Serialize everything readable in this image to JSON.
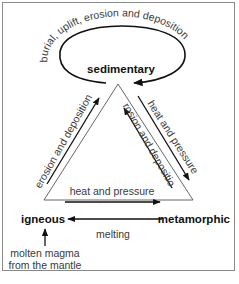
{
  "diagram": {
    "nodes": {
      "sedimentary": "sedimentary",
      "igneous": "igneous",
      "metamorphic": "metamorphic"
    },
    "labels": {
      "loop": "burial, uplift, erosion and deposition",
      "igneous_to_sedimentary": "erosion and deposition",
      "sedimentary_to_metamorphic": "heat and pressure",
      "metamorphic_to_sedimentary": "erosion and deposition",
      "igneous_to_metamorphic": "heat and pressure",
      "metamorphic_to_igneous": "melting",
      "source_line1": "molten magma",
      "source_line2": "from the mantle"
    },
    "colors": {
      "arrow": "#111111",
      "triangle": "#555555",
      "text": "#3a3a3a",
      "frame": "#8a8a8a"
    }
  }
}
